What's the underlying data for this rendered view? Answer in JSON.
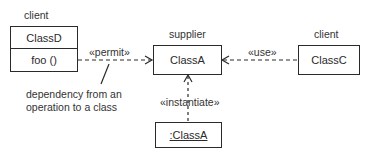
{
  "diagram": {
    "type": "uml-class-dependency",
    "classes": [
      {
        "id": "classD",
        "name": "ClassD",
        "role_label": "client",
        "operations": [
          "foo ()"
        ]
      },
      {
        "id": "classA",
        "name": "ClassA",
        "role_label": "supplier"
      },
      {
        "id": "classC",
        "name": "ClassC",
        "role_label": "client"
      },
      {
        "id": "instanceA",
        "name": ":ClassA",
        "is_instance": true
      }
    ],
    "dependencies": [
      {
        "from": "classD.foo ()",
        "to": "classA",
        "stereotype": "«permit»"
      },
      {
        "from": "classC",
        "to": "classA",
        "stereotype": "«use»"
      },
      {
        "from": "instanceA",
        "to": "classA",
        "stereotype": "«instantiate»"
      }
    ],
    "note": {
      "line1": "dependency from an",
      "line2": "operation to a class"
    }
  }
}
